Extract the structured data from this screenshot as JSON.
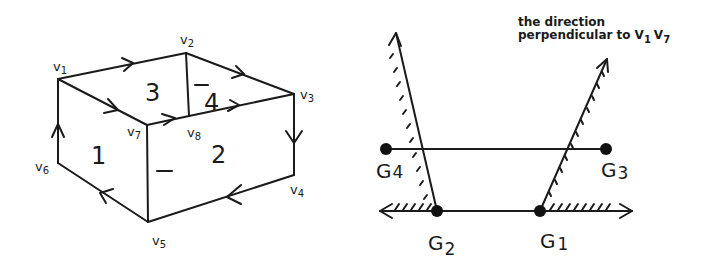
{
  "left_diagram": {
    "description": "Oriented box-like polyhedral complex with faces 1-4",
    "vertices": [
      {
        "name": "v",
        "sub": "1"
      },
      {
        "name": "v",
        "sub": "2"
      },
      {
        "name": "v",
        "sub": "3"
      },
      {
        "name": "v",
        "sub": "4"
      },
      {
        "name": "v",
        "sub": "5"
      },
      {
        "name": "v",
        "sub": "6"
      },
      {
        "name": "v",
        "sub": "7"
      },
      {
        "name": "v",
        "sub": "8"
      }
    ],
    "faces": [
      {
        "label": "1",
        "sign": ""
      },
      {
        "label": "2",
        "sign": "–"
      },
      {
        "label": "3",
        "sign": ""
      },
      {
        "label": "4",
        "sign": "–"
      }
    ],
    "edges": [
      {
        "from": "v1",
        "to": "v2",
        "arrow": "forward"
      },
      {
        "from": "v2",
        "to": "v3",
        "arrow": "forward"
      },
      {
        "from": "v3",
        "to": "v4",
        "arrow": "forward"
      },
      {
        "from": "v4",
        "to": "v5",
        "arrow": "forward"
      },
      {
        "from": "v5",
        "to": "v6",
        "arrow": "forward"
      },
      {
        "from": "v6",
        "to": "v1",
        "arrow": "forward"
      },
      {
        "from": "v1",
        "to": "v7",
        "arrow": "forward"
      },
      {
        "from": "v7",
        "to": "v8",
        "arrow": "forward"
      },
      {
        "from": "v8",
        "to": "v3",
        "arrow": "forward"
      },
      {
        "from": "v2",
        "to": "v8",
        "arrow": "none"
      },
      {
        "from": "v7",
        "to": "v5",
        "arrow": "none"
      }
    ]
  },
  "right_diagram": {
    "caption_line1": "the direction",
    "caption_line2": "perpendicular to",
    "caption_v1": {
      "name": "V",
      "sub": "1"
    },
    "caption_v7": {
      "name": "V",
      "sub": "7"
    },
    "points": [
      {
        "name": "G",
        "sub": "1"
      },
      {
        "name": "G",
        "sub": "2"
      },
      {
        "name": "G",
        "sub": "3"
      },
      {
        "name": "G",
        "sub": "4"
      }
    ]
  }
}
